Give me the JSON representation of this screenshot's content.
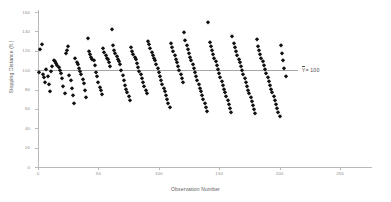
{
  "chart": {
    "title": "",
    "y_axis_title": "Stopping Distance (ft.)",
    "x_axis_title": "Observation Number",
    "mean_label": "= 100",
    "mean_symbol": "Y"
  },
  "chart_data": {
    "type": "scatter",
    "title": "",
    "xlabel": "Observation Number",
    "ylabel": "Stopping Distance (ft.)",
    "xlim": [
      0,
      250
    ],
    "ylim": [
      0,
      160
    ],
    "xticks": [
      0,
      50,
      100,
      150,
      200,
      250
    ],
    "yticks": [
      0,
      20,
      40,
      60,
      80,
      100,
      120,
      140,
      160
    ],
    "grid": false,
    "legend": "none",
    "marker": "diamond",
    "marker_color": "#111111",
    "annotations": [
      {
        "text": "Ȳ = 100",
        "type": "reference-line-label",
        "value": 100,
        "line_color": "#a6a6a6",
        "line_from_x": 0,
        "line_to_x": 215
      }
    ],
    "series": [
      {
        "name": "Stopping Distance",
        "x": [
          1,
          2,
          3,
          4,
          5,
          6,
          7,
          8,
          9,
          10,
          11,
          12,
          13,
          14,
          15,
          16,
          17,
          18,
          19,
          20,
          21,
          22,
          23,
          24,
          25,
          26,
          27,
          28,
          29,
          30,
          31,
          32,
          33,
          34,
          35,
          36,
          37,
          38,
          39,
          40,
          41,
          42,
          43,
          44,
          45,
          46,
          47,
          48,
          49,
          50,
          51,
          52,
          53,
          54,
          55,
          56,
          57,
          58,
          59,
          60,
          61,
          62,
          63,
          64,
          65,
          66,
          67,
          68,
          69,
          70,
          71,
          72,
          73,
          74,
          75,
          76,
          77,
          78,
          79,
          80,
          81,
          82,
          83,
          84,
          85,
          86,
          87,
          88,
          89,
          90,
          91,
          92,
          93,
          94,
          95,
          96,
          97,
          98,
          99,
          100,
          101,
          102,
          103,
          104,
          105,
          106,
          107,
          108,
          109,
          110,
          111,
          112,
          113,
          114,
          115,
          116,
          117,
          118,
          119,
          120,
          121,
          122,
          123,
          124,
          125,
          126,
          127,
          128,
          129,
          130,
          131,
          132,
          133,
          134,
          135,
          136,
          137,
          138,
          139,
          140,
          141,
          142,
          143,
          144,
          145,
          146,
          147,
          148,
          149,
          150,
          151,
          152,
          153,
          154,
          155,
          156,
          157,
          158,
          159,
          160,
          161,
          162,
          163,
          164,
          165,
          166,
          167,
          168,
          169,
          170,
          171,
          172,
          173,
          174,
          175,
          176,
          177,
          178,
          179,
          180,
          181,
          182,
          183,
          184,
          185,
          186,
          187,
          188,
          189,
          190,
          191,
          192,
          193,
          194,
          195,
          196,
          197,
          198,
          199,
          200,
          201,
          202,
          203,
          204,
          205
        ],
        "y": [
          98,
          122,
          127,
          96,
          93,
          88,
          101,
          94,
          86,
          78,
          99,
          104,
          110,
          109,
          107,
          105,
          103,
          100,
          97,
          92,
          84,
          76,
          118,
          121,
          125,
          95,
          90,
          82,
          74,
          66,
          113,
          108,
          106,
          102,
          99,
          96,
          91,
          87,
          80,
          72,
          133,
          120,
          117,
          114,
          112,
          110,
          105,
          98,
          94,
          88,
          83,
          79,
          75,
          123,
          119,
          116,
          113,
          111,
          108,
          104,
          142,
          126,
          121,
          118,
          115,
          112,
          109,
          106,
          100,
          95,
          90,
          85,
          81,
          77,
          73,
          69,
          124,
          120,
          117,
          114,
          111,
          107,
          103,
          99,
          96,
          92,
          88,
          84,
          80,
          76,
          130,
          127,
          123,
          119,
          116,
          113,
          110,
          106,
          102,
          98,
          94,
          90,
          86,
          82,
          78,
          74,
          70,
          66,
          62,
          128,
          124,
          120,
          116,
          112,
          108,
          104,
          100,
          96,
          92,
          88,
          139,
          131,
          126,
          122,
          118,
          114,
          110,
          106,
          102,
          98,
          94,
          90,
          86,
          82,
          78,
          74,
          70,
          66,
          62,
          58,
          150,
          129,
          125,
          121,
          117,
          113,
          109,
          105,
          101,
          97,
          93,
          89,
          85,
          81,
          77,
          73,
          69,
          65,
          61,
          57,
          135,
          128,
          124,
          120,
          116,
          112,
          108,
          104,
          100,
          96,
          92,
          88,
          84,
          80,
          76,
          72,
          68,
          64,
          60,
          56,
          132,
          125,
          121,
          117,
          113,
          109,
          105,
          101,
          97,
          93,
          89,
          85,
          81,
          77,
          73,
          69,
          65,
          61,
          57,
          53,
          126,
          118,
          110,
          102,
          94
        ]
      }
    ]
  }
}
